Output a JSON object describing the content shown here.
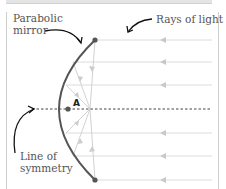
{
  "diagram": {
    "labels": {
      "mirror": "Parabolic\nmirror",
      "mirror_line1": "Parabolic",
      "mirror_line2": "mirror",
      "rays": "Rays of light",
      "symmetry_line1": "Line of",
      "symmetry_line2": "symmetry",
      "focal_point": "A"
    },
    "colors": {
      "mirror": "#555555",
      "rays": "#d8d8d8",
      "ray_arrows": "#c4c4c4",
      "reflected_rays": "#cfcfcf",
      "symmetry_line": "#444444",
      "focal_point": "#555555",
      "annotation_arrows": "#111111",
      "text": "#555555"
    },
    "ray_y_positions": [
      40,
      62,
      85,
      133,
      156,
      180
    ],
    "symmetry_y": 109,
    "focal_point_xy": [
      90,
      109
    ],
    "mirror_endpoints": [
      [
        95,
        40
      ],
      [
        95,
        180
      ]
    ]
  }
}
